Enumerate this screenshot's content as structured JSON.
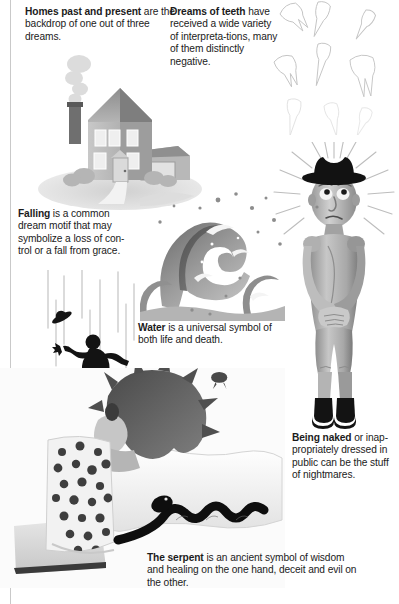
{
  "page": {
    "background_color": "#ffffff",
    "text_color": "#1b1b1b"
  },
  "captions": {
    "homes": {
      "lead": "Homes past and present",
      "body": " are the backdrop of one out of three dreams.",
      "full": "Homes past and present are the backdrop of one out of three dreams."
    },
    "teeth": {
      "lead": "Dreams of teeth",
      "body": " have received a wide variety of interpreta-tions, many of them distinctly negative.",
      "full": "Dreams of teeth have received a wide variety of interpretations, many of them distinctly negative."
    },
    "falling": {
      "lead": "Falling",
      "body": " is a common dream motif that may symbolize a loss of con-trol or a fall from grace.",
      "full": "Falling is a common dream motif that may symbolize a loss of control or a fall from grace."
    },
    "water": {
      "lead": "Water",
      "body": " is a universal symbol of both life and death.",
      "full": "Water is a universal symbol of both life and death."
    },
    "naked": {
      "lead": "Being naked",
      "body": " or inap-propriately dressed in public can be the stuff of nightmares.",
      "full": "Being naked or inappropriately dressed in public can be the stuff of nightmares."
    },
    "serpent": {
      "lead": "The serpent",
      "body": " is an ancient symbol of wisdom and healing on the one hand, deceit and evil on the other.",
      "full": "The serpent is an ancient symbol of wisdom and healing on the one hand, deceit and evil on the other."
    }
  },
  "illustrations": {
    "house": {
      "name": "house-illustration",
      "description": "Grayscale two-story house with chimney smoke, windows, front door, attached garage and bushes"
    },
    "teeth": {
      "name": "teeth-illustration",
      "description": "Scattered white human teeth with roots, light gray outlines"
    },
    "falling": {
      "name": "falling-man-illustration",
      "description": "Black silhouette of a man falling, hat flying off, vertical motion streak lines"
    },
    "wave": {
      "name": "wave-illustration",
      "description": "Grayscale curling ocean wave with foam crests and spray droplets"
    },
    "naked": {
      "name": "naked-man-illustration",
      "description": "Sculpted figure of a naked man wearing a black cowboy hat and black boots, hands covering groin, radiating sunburst lines behind head"
    },
    "bed": {
      "name": "sleeper-and-serpent-illustration",
      "description": "Person with dark hair asleep on a white pillow under a polka-dot blanket with a black snake slithering across the bed"
    }
  },
  "colors": {
    "ink": "#1b1b1b",
    "paper": "#ffffff",
    "rule": "#c9c9c9",
    "silhouette": "#111111",
    "midgray": "#9a9a9a",
    "lightgray": "#d9d9d9",
    "darkgray": "#5b5b5b"
  }
}
